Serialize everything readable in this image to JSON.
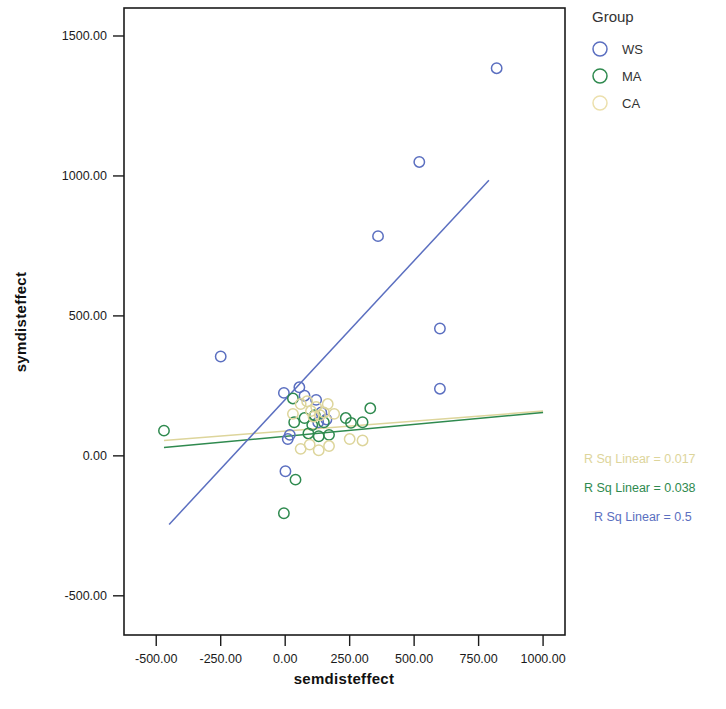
{
  "chart_data": {
    "type": "scatter",
    "title": "",
    "xlabel": "semdisteffect",
    "ylabel": "symdisteffect",
    "xlim": [
      -625,
      1085
    ],
    "ylim": [
      -640,
      1600
    ],
    "grid": false,
    "xticks": [
      "-500.00",
      "-250.00",
      "0.00",
      "250.00",
      "500.00",
      "750.00",
      "1000.00"
    ],
    "xtick_values": [
      -500,
      -250,
      0,
      250,
      500,
      750,
      1000
    ],
    "yticks": [
      "1500.00",
      "1000.00",
      "500.00",
      "0.00",
      "-500.00"
    ],
    "ytick_values": [
      1500,
      1000,
      500,
      0,
      -500
    ],
    "legend": {
      "title": "Group",
      "position": "right-top",
      "entries": [
        {
          "label": "WS",
          "color": "#5b6fc0",
          "marker": "open-circle"
        },
        {
          "label": "MA",
          "color": "#2f8a4f",
          "marker": "open-circle"
        },
        {
          "label": "CA",
          "color": "#ece0ad",
          "marker": "open-circle"
        }
      ]
    },
    "series": [
      {
        "name": "WS",
        "color": "#5b6fc0",
        "points": [
          [
            -250,
            355
          ],
          [
            -5,
            225
          ],
          [
            10,
            60
          ],
          [
            18,
            75
          ],
          [
            55,
            245
          ],
          [
            75,
            215
          ],
          [
            120,
            200
          ],
          [
            128,
            120
          ],
          [
            140,
            155
          ],
          [
            160,
            130
          ],
          [
            1,
            -55
          ],
          [
            360,
            785
          ],
          [
            520,
            1050
          ],
          [
            600,
            455
          ],
          [
            600,
            240
          ],
          [
            820,
            1385
          ]
        ]
      },
      {
        "name": "MA",
        "color": "#2f8a4f",
        "points": [
          [
            -470,
            90
          ],
          [
            30,
            205
          ],
          [
            35,
            120
          ],
          [
            75,
            135
          ],
          [
            90,
            80
          ],
          [
            105,
            110
          ],
          [
            115,
            145
          ],
          [
            130,
            70
          ],
          [
            150,
            120
          ],
          [
            170,
            75
          ],
          [
            235,
            135
          ],
          [
            255,
            118
          ],
          [
            300,
            120
          ],
          [
            330,
            170
          ],
          [
            40,
            -85
          ],
          [
            -5,
            -205
          ]
        ]
      },
      {
        "name": "CA",
        "color": "#ddd59b",
        "points": [
          [
            30,
            150
          ],
          [
            60,
            185
          ],
          [
            85,
            195
          ],
          [
            100,
            160
          ],
          [
            110,
            140
          ],
          [
            120,
            175
          ],
          [
            135,
            145
          ],
          [
            150,
            155
          ],
          [
            165,
            185
          ],
          [
            190,
            150
          ],
          [
            60,
            25
          ],
          [
            95,
            40
          ],
          [
            130,
            20
          ],
          [
            170,
            35
          ],
          [
            250,
            60
          ],
          [
            300,
            55
          ]
        ]
      }
    ],
    "fit_lines": [
      {
        "group": "CA",
        "color": "#ddd59b",
        "r_sq_label": "R Sq Linear = 0.017",
        "r_sq_value": 0.017,
        "x_from": -470,
        "y_from": 55,
        "x_to": 1000,
        "y_to": 160
      },
      {
        "group": "MA",
        "color": "#2f8a4f",
        "r_sq_label": "R Sq Linear = 0.038",
        "r_sq_value": 0.038,
        "x_from": -470,
        "y_from": 30,
        "x_to": 1000,
        "y_to": 155
      },
      {
        "group": "WS",
        "color": "#5b6fc0",
        "r_sq_label": "R Sq Linear = 0.5",
        "r_sq_value": 0.5,
        "x_from": -450,
        "y_from": -245,
        "x_to": 790,
        "y_to": 985
      }
    ]
  }
}
